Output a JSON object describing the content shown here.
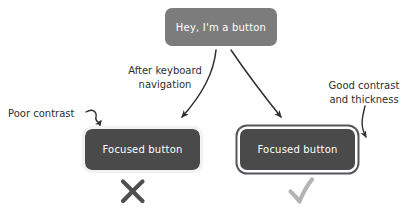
{
  "diagram": {
    "background_color": "#ffffff",
    "buttons": {
      "resting": {
        "label": "Hey, I'm a button",
        "fill_color": "#7c7c7c",
        "text_color": "#ffffff",
        "state": "default"
      },
      "poor_focus": {
        "label": "Focused button",
        "fill_color": "#4a4a4a",
        "text_color": "#ffffff",
        "ring_color": "#f2f2f2",
        "state": "focused"
      },
      "good_focus": {
        "label": "Focused button",
        "fill_color": "#4a4a4a",
        "text_color": "#ffffff",
        "ring_inner_color": "#ffffff",
        "ring_outer_color": "#56565a",
        "state": "focused"
      }
    },
    "annotations": {
      "transition": "After keyboard\nnavigation",
      "poor": "Poor contrast",
      "good": "Good contrast\nand thickness"
    },
    "verdicts": {
      "fail": {
        "symbol": "cross-mark",
        "color": "#4f4f4f"
      },
      "pass": {
        "symbol": "check-mark",
        "color": "#b4b4b4"
      }
    },
    "arrow_color": "#2f2f2f"
  }
}
